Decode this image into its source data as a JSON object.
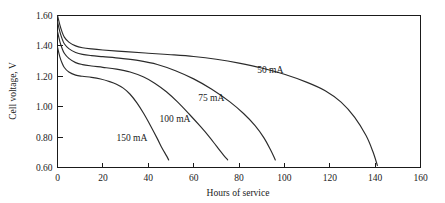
{
  "chart_data": {
    "type": "line",
    "title": "",
    "xlabel": "Hours of service",
    "ylabel": "Cell voltage, V",
    "xlim": [
      0,
      160
    ],
    "ylim": [
      0.6,
      1.6
    ],
    "xticks": [
      "0",
      "20",
      "40",
      "60",
      "80",
      "100",
      "120",
      "140",
      "160"
    ],
    "yticks": [
      "0.60",
      "0.80",
      "1.00",
      "1.20",
      "1.40",
      "1.60"
    ],
    "grid": false,
    "legend_position": "inline-annotations",
    "line_color": "#2b2b2b",
    "background_color": "#ffffff",
    "series": [
      {
        "name": "50 mA",
        "label": "50 mA",
        "label_x": 88,
        "label_y": 1.225,
        "x": [
          0,
          1,
          2,
          3,
          5,
          8,
          11,
          15,
          20,
          30,
          40,
          50,
          60,
          70,
          80,
          90,
          100,
          110,
          118,
          125,
          131,
          136,
          139,
          141
        ],
        "y": [
          1.6,
          1.54,
          1.492,
          1.458,
          1.425,
          1.4,
          1.388,
          1.38,
          1.373,
          1.362,
          1.352,
          1.342,
          1.33,
          1.312,
          1.287,
          1.255,
          1.213,
          1.16,
          1.105,
          1.03,
          0.93,
          0.81,
          0.705,
          0.613
        ]
      },
      {
        "name": "75 mA",
        "label": "75 mA",
        "label_x": 62,
        "label_y": 1.035,
        "x": [
          0,
          1,
          2,
          3,
          5,
          8,
          11,
          15,
          20,
          28,
          36,
          44,
          52,
          60,
          68,
          76,
          82,
          87,
          91,
          94,
          96
        ],
        "y": [
          1.56,
          1.495,
          1.448,
          1.414,
          1.382,
          1.357,
          1.344,
          1.336,
          1.329,
          1.318,
          1.303,
          1.278,
          1.237,
          1.183,
          1.115,
          1.032,
          0.955,
          0.877,
          0.795,
          0.713,
          0.65
        ]
      },
      {
        "name": "100 mA",
        "label": "100 mA",
        "label_x": 45,
        "label_y": 0.9,
        "x": [
          0,
          1,
          2,
          3,
          5,
          8,
          11,
          15,
          20,
          26,
          32,
          38,
          43,
          48,
          53,
          58,
          63,
          67,
          70,
          73,
          75
        ],
        "y": [
          1.495,
          1.43,
          1.385,
          1.352,
          1.318,
          1.29,
          1.277,
          1.268,
          1.259,
          1.247,
          1.228,
          1.195,
          1.153,
          1.098,
          1.03,
          0.952,
          0.87,
          0.8,
          0.742,
          0.685,
          0.65
        ]
      },
      {
        "name": "150 mA",
        "label": "150 mA",
        "label_x": 26,
        "label_y": 0.775,
        "x": [
          0,
          1,
          2,
          3,
          5,
          8,
          11,
          15,
          19,
          23,
          26,
          29,
          32,
          35,
          38,
          41,
          44,
          46,
          48,
          49
        ],
        "y": [
          1.392,
          1.33,
          1.288,
          1.258,
          1.228,
          1.208,
          1.2,
          1.193,
          1.182,
          1.165,
          1.148,
          1.122,
          1.082,
          1.025,
          0.955,
          0.875,
          0.79,
          0.73,
          0.678,
          0.65
        ]
      }
    ]
  }
}
